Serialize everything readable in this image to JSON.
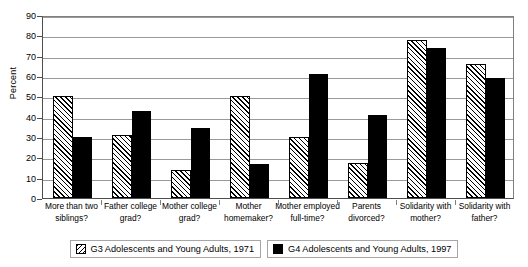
{
  "chart_data": {
    "type": "bar",
    "title": "",
    "xlabel": "",
    "ylabel": "Percent",
    "ylim": [
      0,
      90
    ],
    "ytick_step": 10,
    "yticks": [
      0,
      10,
      20,
      30,
      40,
      50,
      60,
      70,
      80,
      90
    ],
    "grid": "horizontal",
    "legend_position": "bottom",
    "categories": [
      "More than two siblings?",
      "Father college grad?",
      "Mother college grad?",
      "Mother homemaker?",
      "Mother employed full-time?",
      "Parents divorced?",
      "Solidarity with mother?",
      "Solidarity with father?"
    ],
    "category_lines": [
      [
        "More than two",
        "siblings?"
      ],
      [
        "Father college",
        "grad?"
      ],
      [
        "Mother college",
        "grad?"
      ],
      [
        "Mother",
        "homemaker?"
      ],
      [
        "Mother employed",
        "full-time?"
      ],
      [
        "Parents",
        "divorced?"
      ],
      [
        "Solidarity with",
        "mother?"
      ],
      [
        "Solidarity with",
        "father?"
      ]
    ],
    "series": [
      {
        "name": "G3 Adolescents and Young Adults, 1971",
        "fill": "hatched",
        "color": "#ffffff",
        "values": [
          50,
          31,
          14,
          50,
          30,
          17,
          77.5,
          66
        ]
      },
      {
        "name": "G4 Adolescents and Young Adults, 1997",
        "fill": "solid",
        "color": "#000000",
        "values": [
          30,
          43,
          34.5,
          16.5,
          61,
          41,
          74,
          59
        ]
      }
    ]
  },
  "axis": {
    "y_label": "Percent"
  }
}
